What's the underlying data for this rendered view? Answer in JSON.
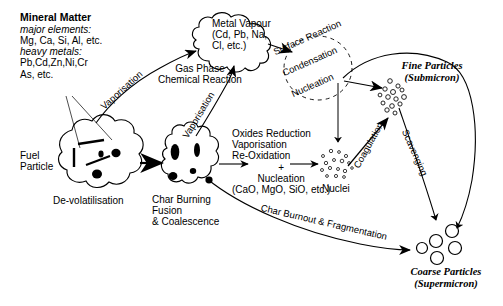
{
  "diagram": {
    "type": "process-flow-diagram",
    "stroke_color": "#000000",
    "background_color": "#ffffff",
    "width": 503,
    "height": 306
  },
  "mineral_matter": {
    "heading": "Mineral Matter",
    "major_label": "major elements:",
    "major_values": "Mg, Ca, Si, Al, etc.",
    "heavy_label": "heavy metals:",
    "heavy_values_1": "Pb,Cd,Zn,Ni,Cr",
    "heavy_values_2": "As, etc."
  },
  "nodes": {
    "fuel_particle": {
      "line1": "Fuel",
      "line2": "Particle"
    },
    "devolatilisation": "De-volatilisation",
    "char": {
      "line1": "Char Burning",
      "line2": "Fusion",
      "line3": "& Coalescence"
    },
    "metal_vapour": {
      "line1": "Metal Vapour",
      "line2": "(Cd, Pb, Na,",
      "line3": "Cl, etc.)"
    },
    "gas_phase": {
      "line1": "Gas Phase",
      "line2": "Chemical Reaction"
    },
    "oxides": {
      "line1": "Oxides Reduction",
      "line2": "Vaporisation",
      "line3": "Re-Oxidation",
      "line4": "+",
      "line5": "Nucleation",
      "line6": "(CaO, MgO, SiO, etc.)"
    },
    "nuclei": "Nuclei",
    "fine_particles": {
      "line1": "Fine Particles",
      "line2": "(Submicron)"
    },
    "coarse_particles": {
      "line1": "Coarse Particles",
      "line2": "(Supermicron)"
    }
  },
  "process_labels": {
    "vaporisation_mineral": "Vaporisation",
    "vaporisation_char": "Vaporisation",
    "surface_reaction": "Surface  Reaction",
    "condensation": "Condensation",
    "nucleation": "Nucleation",
    "coagulation": "Coagulation",
    "scavenging": "Scavenging",
    "char_burnout": "Char Burnout & Fragmentation"
  }
}
